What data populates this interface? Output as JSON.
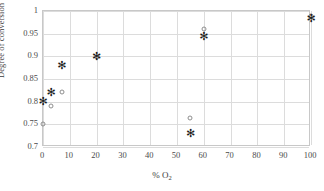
{
  "chart_data": {
    "type": "scatter",
    "title": "",
    "xlabel": "% O2",
    "xlabel_display": "% O",
    "xlabel_sub": "2",
    "ylabel": "Degree of conversion Si",
    "xlim": [
      0,
      100
    ],
    "ylim": [
      0.7,
      1.0
    ],
    "grid": true,
    "legend": "none",
    "xticks": [
      0,
      10,
      20,
      30,
      40,
      50,
      60,
      70,
      80,
      90,
      100
    ],
    "xtick_labels": [
      "0",
      "10",
      "20",
      "30",
      "40",
      "50",
      "60",
      "70",
      "80",
      "90",
      "100"
    ],
    "yticks": [
      0.7,
      0.75,
      0.8,
      0.85,
      0.9,
      0.95,
      1.0
    ],
    "ytick_labels": [
      "0.7",
      "0.75",
      "0.8",
      "0.85",
      "0.9",
      "0.95",
      "1"
    ],
    "series": [
      {
        "name": "circle-series",
        "marker": "circle",
        "color": "#8e8e8e",
        "points": [
          {
            "x": 0,
            "y": 0.75
          },
          {
            "x": 3,
            "y": 0.79
          },
          {
            "x": 7,
            "y": 0.822
          },
          {
            "x": 20,
            "y": 0.899
          },
          {
            "x": 55,
            "y": 0.763
          },
          {
            "x": 60,
            "y": 0.96
          },
          {
            "x": 100,
            "y": 0.99
          }
        ]
      },
      {
        "name": "asterisk-series",
        "marker": "asterisk",
        "color": "#1c1c1c",
        "glyph": "✻",
        "points": [
          {
            "x": 0,
            "y": 0.8
          },
          {
            "x": 3,
            "y": 0.82
          },
          {
            "x": 7,
            "y": 0.878
          },
          {
            "x": 20,
            "y": 0.899
          },
          {
            "x": 55,
            "y": 0.728
          },
          {
            "x": 60,
            "y": 0.942
          },
          {
            "x": 100,
            "y": 0.983
          }
        ]
      }
    ]
  },
  "figure": {
    "background": "#ffffff",
    "frame_color": "#c8c8c8",
    "grid_color": "#dcdcdc",
    "text_color": "#3b3b3b"
  }
}
